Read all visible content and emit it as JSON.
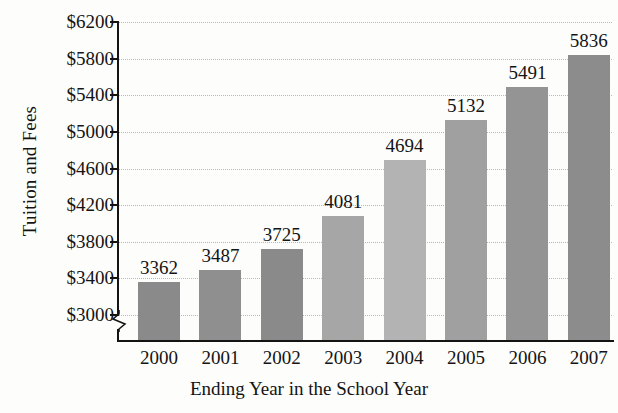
{
  "chart_data": {
    "type": "bar",
    "title": "",
    "xlabel": "Ending Year in the School Year",
    "ylabel": "Tuition and Fees",
    "categories": [
      "2000",
      "2001",
      "2002",
      "2003",
      "2004",
      "2005",
      "2006",
      "2007"
    ],
    "values": [
      3362,
      3487,
      3725,
      4081,
      4694,
      5132,
      5491,
      5836
    ],
    "value_labels": [
      "3362",
      "3487",
      "3725",
      "4081",
      "4694",
      "5132",
      "5491",
      "5836"
    ],
    "bar_colors": [
      "#8a8a8a",
      "#8f8f8f",
      "#8a8a8a",
      "#a6a6a6",
      "#b3b3b3",
      "#a0a0a0",
      "#949494",
      "#8c8c8c"
    ],
    "ytick_values": [
      3000,
      3400,
      3800,
      4200,
      4600,
      5000,
      5400,
      5800,
      6200
    ],
    "ytick_labels": [
      "$3000",
      "$3400",
      "$3800",
      "$4200",
      "$4600",
      "$5000",
      "$5400",
      "$5800",
      "$6200"
    ],
    "ylim": [
      3000,
      6200
    ],
    "y_axis_break": true,
    "grid": true,
    "grid_style": "dotted",
    "grid_color": "#b9b9b9",
    "legend": "none",
    "axis_color": "#141414",
    "background_color": "#fdfdfc"
  }
}
